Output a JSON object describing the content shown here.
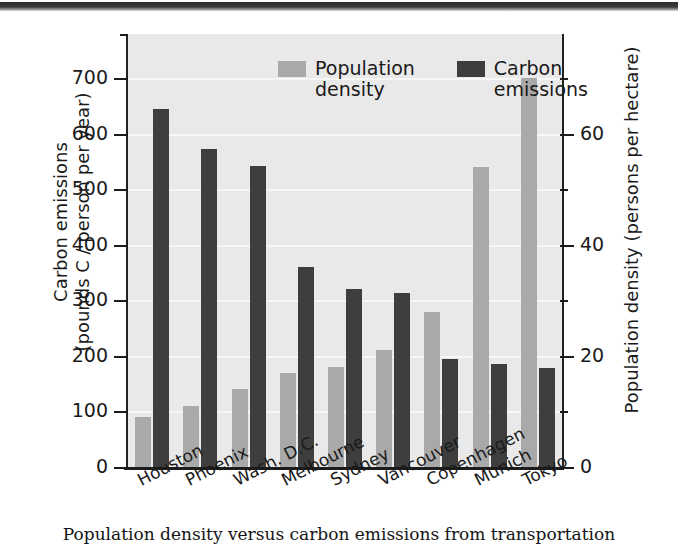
{
  "caption": "Population density versus carbon emissions from transportation",
  "legend": {
    "position": "top-left-inside",
    "entries": [
      {
        "label": "Population density",
        "color": "#a9a9a9",
        "key": "population_density"
      },
      {
        "label": "Carbon emissions",
        "color": "#3e3e3e",
        "key": "carbon_emissions"
      }
    ]
  },
  "chart_data": {
    "type": "bar",
    "title": "",
    "xlabel": "",
    "grid": true,
    "categories": [
      "Houston",
      "Phoenix",
      "Wash. D.C.",
      "Melbourne",
      "Sydney",
      "Vancouver",
      "Copenhagen",
      "Munich",
      "Tokyo"
    ],
    "series": [
      {
        "name": "Population density",
        "axis": "right",
        "unit": "persons per hectare",
        "color": "#a9a9a9",
        "values": [
          9,
          11,
          14,
          17,
          18,
          21,
          28,
          54,
          70
        ]
      },
      {
        "name": "Carbon emissions",
        "axis": "left",
        "unit": "pounds C / person per year",
        "color": "#3e3e3e",
        "values": [
          645,
          573,
          542,
          360,
          321,
          313,
          194,
          186,
          178
        ]
      }
    ],
    "left_axis": {
      "label": "Carbon emissions (pounds C / person per year)",
      "label_line1": "Carbon emissions",
      "label_line2": "(pounds C / person per year)",
      "ticks": [
        0,
        100,
        200,
        300,
        400,
        500,
        600,
        700
      ],
      "ylim": [
        0,
        780
      ]
    },
    "right_axis": {
      "label": "Population density (persons per hectare)",
      "ticks": [
        0,
        20,
        40,
        60
      ],
      "minor_ticks": [
        10,
        30,
        50,
        70
      ],
      "ylim": [
        0,
        78
      ]
    }
  }
}
